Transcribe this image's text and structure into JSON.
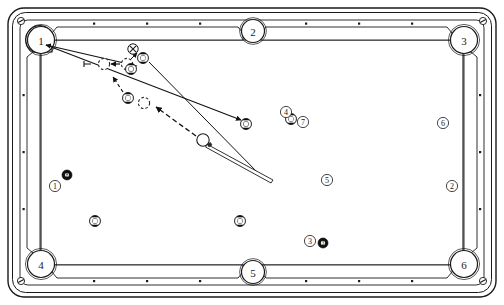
{
  "diagram": {
    "type": "billiards-table-top-view",
    "table": {
      "frame_color": "#ffffff",
      "rail_color": "#ffffff",
      "outline_color": "#1a1a1a",
      "cloth_color": "#ffffff",
      "diamond_count_long_rail": 3,
      "diamond_count_short_rail": 2
    },
    "pockets": [
      {
        "id": "pocket-1",
        "label": "1",
        "kind": "corner",
        "x": 41,
        "y": 38
      },
      {
        "id": "pocket-2",
        "label": "2",
        "kind": "side",
        "x": 253,
        "y": 30
      },
      {
        "id": "pocket-3",
        "label": "3",
        "kind": "corner",
        "x": 465,
        "y": 38
      },
      {
        "id": "pocket-4",
        "label": "4",
        "kind": "corner",
        "x": 41,
        "y": 264
      },
      {
        "id": "pocket-5",
        "label": "5",
        "kind": "side",
        "x": 253,
        "y": 270
      },
      {
        "id": "pocket-6",
        "label": "6",
        "kind": "corner",
        "x": 465,
        "y": 264
      }
    ],
    "position_markers": [
      {
        "id": "marker-1",
        "label": "1",
        "x": 55,
        "y": 186
      },
      {
        "id": "marker-2",
        "label": "2",
        "x": 452,
        "y": 186
      },
      {
        "id": "marker-3",
        "label": "3",
        "x": 310,
        "y": 241
      },
      {
        "id": "marker-4",
        "label": "4",
        "x": 286,
        "y": 112
      },
      {
        "id": "marker-5",
        "label": "5",
        "x": 327,
        "y": 180
      },
      {
        "id": "marker-6",
        "label": "6",
        "x": 443,
        "y": 123
      },
      {
        "id": "marker-7",
        "label": "7",
        "x": 303,
        "y": 122
      }
    ],
    "balls": [
      {
        "id": "ball-8",
        "label": "8",
        "style": "solid",
        "x": 67,
        "y": 175,
        "r": 5.0
      },
      {
        "id": "ball-13",
        "label": "13",
        "style": "stripe",
        "x": 95,
        "y": 221,
        "r": 5.4
      },
      {
        "id": "ball-11",
        "label": "11",
        "style": "stripe",
        "x": 240,
        "y": 221,
        "r": 5.4
      },
      {
        "id": "ball-14",
        "label": "14",
        "style": "stripe",
        "x": 143,
        "y": 58,
        "r": 5.4
      },
      {
        "id": "ball-9",
        "label": "9",
        "style": "stripe",
        "x": 131,
        "y": 69,
        "r": 5.4
      },
      {
        "id": "ball-10",
        "label": "10",
        "style": "stripe",
        "x": 128,
        "y": 98,
        "r": 5.4
      },
      {
        "id": "ball-12",
        "label": "12",
        "style": "stripe",
        "x": 291,
        "y": 119,
        "r": 5.4
      },
      {
        "id": "ball-target",
        "label": "2",
        "style": "stripe",
        "x": 246,
        "y": 124,
        "r": 5.4
      },
      {
        "id": "ball-3",
        "label": "3",
        "style": "solid",
        "x": 323,
        "y": 243,
        "r": 5.0
      }
    ],
    "cue_ball": {
      "id": "cue-ball",
      "x": 203,
      "y": 140,
      "r": 6.2
    },
    "ghost_balls": [
      {
        "id": "ghost-a",
        "x": 104,
        "y": 64,
        "r": 5.6
      },
      {
        "id": "ghost-b",
        "x": 127,
        "y": 64,
        "r": 5.6
      },
      {
        "id": "ghost-c",
        "x": 144,
        "y": 103,
        "r": 5.6
      }
    ],
    "marker_x": {
      "id": "x-mark",
      "label": "X",
      "x": 133,
      "y": 49,
      "r": 5.2
    },
    "annotation_tick": {
      "id": "gap-tick",
      "x": 88,
      "y": 64
    },
    "aim_lines": [
      {
        "id": "aim-line-pocket1-to-ball9",
        "x1": 44,
        "y1": 44,
        "x2": 137,
        "y2": 66,
        "style": "solid",
        "arrow": "start"
      },
      {
        "id": "aim-line-pocket1-to-target",
        "x1": 44,
        "y1": 44,
        "x2": 243,
        "y2": 121,
        "style": "solid",
        "arrow": "end"
      },
      {
        "id": "aim-line-ball14-down",
        "x1": 150,
        "y1": 63,
        "x2": 258,
        "y2": 172,
        "style": "solid",
        "arrow": "none"
      },
      {
        "id": "cut-arrow-ghostb-to-x",
        "x1": 131,
        "y1": 60,
        "x2": 139,
        "y2": 52,
        "style": "solid",
        "arrow": "end"
      },
      {
        "id": "cut-arrow-to-ghostb",
        "x1": 119,
        "y1": 64,
        "x2": 110,
        "y2": 64,
        "style": "solid",
        "arrow": "end"
      },
      {
        "id": "cut-arrow-ball10-up",
        "x1": 122,
        "y1": 91,
        "x2": 112,
        "y2": 76,
        "style": "dashed",
        "arrow": "end"
      },
      {
        "id": "path-cue-to-ghostc",
        "x1": 196,
        "y1": 136,
        "x2": 155,
        "y2": 106,
        "style": "dashed",
        "arrow": "end"
      }
    ],
    "cue_stick": {
      "id": "cue-stick",
      "x1": 208,
      "y1": 144,
      "x2": 272,
      "y2": 178
    },
    "screws": [
      {
        "id": "screw-tl",
        "x": 21,
        "y": 21
      },
      {
        "id": "screw-tr",
        "x": 483,
        "y": 21
      },
      {
        "id": "screw-bl",
        "x": 21,
        "y": 281
      },
      {
        "id": "screw-br",
        "x": 483,
        "y": 281
      }
    ]
  }
}
